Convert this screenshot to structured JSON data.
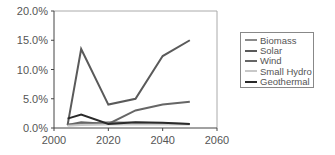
{
  "chart_data": {
    "type": "line",
    "title": "",
    "xlabel": "",
    "ylabel": "",
    "xlim": [
      2000,
      2060
    ],
    "ylim": [
      0,
      20
    ],
    "x_ticks": [
      "2000",
      "2020",
      "2040",
      "2060"
    ],
    "y_ticks": [
      "0.0%",
      "5.0%",
      "10.0%",
      "15.0%",
      "20.0%"
    ],
    "grid": false,
    "legend_position": "right",
    "x": [
      2005,
      2010,
      2020,
      2030,
      2040,
      2050
    ],
    "series": [
      {
        "name": "Biomass",
        "color": "#8a8a8a",
        "values": [
          0.6,
          0.7,
          1.0,
          0.9,
          0.8,
          0.7
        ]
      },
      {
        "name": "Solar",
        "color": "#5a5a5a",
        "values": [
          0.5,
          13.5,
          4.0,
          5.0,
          12.3,
          15.0
        ]
      },
      {
        "name": "Wind",
        "color": "#666666",
        "values": [
          0.5,
          1.0,
          0.7,
          3.0,
          4.0,
          4.5
        ]
      },
      {
        "name": "Small Hydro",
        "color": "#c8c8c8",
        "values": [
          0.4,
          0.5,
          0.6,
          0.6,
          0.6,
          0.6
        ]
      },
      {
        "name": "Geothermal",
        "color": "#2a2a2a",
        "values": [
          1.6,
          2.3,
          0.7,
          1.0,
          0.9,
          0.7
        ]
      }
    ]
  }
}
